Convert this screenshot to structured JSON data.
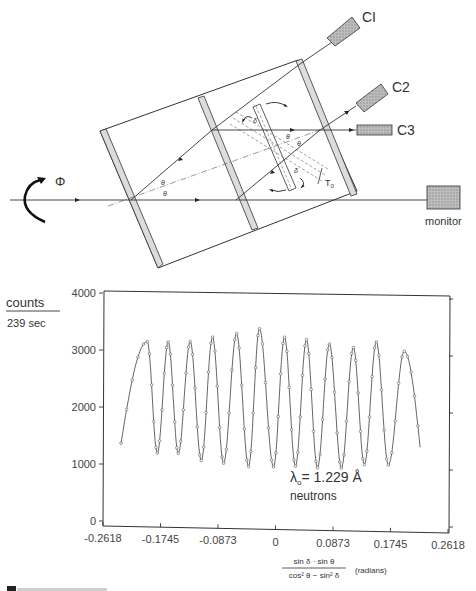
{
  "diagram": {
    "detectors": [
      {
        "id": "C1",
        "label": "CI"
      },
      {
        "id": "C2",
        "label": "C2"
      },
      {
        "id": "C3",
        "label": "C3"
      }
    ],
    "monitor_label": "monitor",
    "rotation_symbol": "Φ",
    "angle_symbol_theta": "θ",
    "angle_symbol_delta": "δ",
    "phase_shifter_label": "T₀",
    "phase_shifter_label_main": "T",
    "phase_shifter_label_sub": "0"
  },
  "chart_data": {
    "type": "line",
    "title": "",
    "ylabel_numerator": "counts",
    "ylabel_denominator": "239 sec",
    "ylabel": "counts / 239 sec",
    "xlabel_numerator": "sin δ · sin θ",
    "xlabel_denominator": "cos² θ − sin² δ",
    "xlabel_units": "(radians)",
    "xlabel": "sin δ · sin θ / (cos² θ − sin² δ) (radians)",
    "xlim": [
      -0.2618,
      0.2618
    ],
    "ylim": [
      0,
      4000
    ],
    "x_ticks": [
      "-0.2618",
      "-0.1745",
      "-0.0873",
      "0",
      "0.0873",
      "0.1745",
      "0.2618"
    ],
    "y_ticks": [
      "0",
      "1000",
      "2000",
      "3000",
      "4000"
    ],
    "grid": false,
    "annotation_line1": "λ₀= 1.229 Å",
    "annotation_lambda": "λ",
    "annotation_lambda_sub": "o",
    "annotation_value": "= 1.229 Å",
    "annotation_line2": "neutrons",
    "series": [
      {
        "name": "neutron interference counts",
        "extrema_x": [
          -0.2345,
          -0.1946,
          -0.1794,
          -0.1628,
          -0.1476,
          -0.1294,
          -0.1127,
          -0.0955,
          -0.0788,
          -0.0591,
          -0.0409,
          -0.0243,
          -0.003,
          0.0137,
          0.0303,
          0.047,
          0.0637,
          0.0818,
          0.1,
          0.1182,
          0.1349,
          0.153,
          0.1713,
          0.1955
        ],
        "extrema_y": [
          1370,
          3160,
          1210,
          3160,
          1210,
          3175,
          1090,
          3260,
          1050,
          3330,
          1000,
          3420,
          1000,
          3280,
          1020,
          3245,
          1000,
          3175,
          1000,
          3120,
          1070,
          3225,
          1070,
          3070
        ],
        "end_point": [
          0.2195,
          1390
        ],
        "peaks_y": [
          3160,
          3160,
          3175,
          3260,
          3330,
          3420,
          3280,
          3245,
          3175,
          3120,
          3225,
          3070
        ],
        "troughs_y": [
          1210,
          1210,
          1090,
          1050,
          1000,
          1000,
          1020,
          1000,
          1000,
          1070,
          1070
        ],
        "num_oscillations": 12
      }
    ]
  },
  "caption_partial": "Figure 10.17"
}
